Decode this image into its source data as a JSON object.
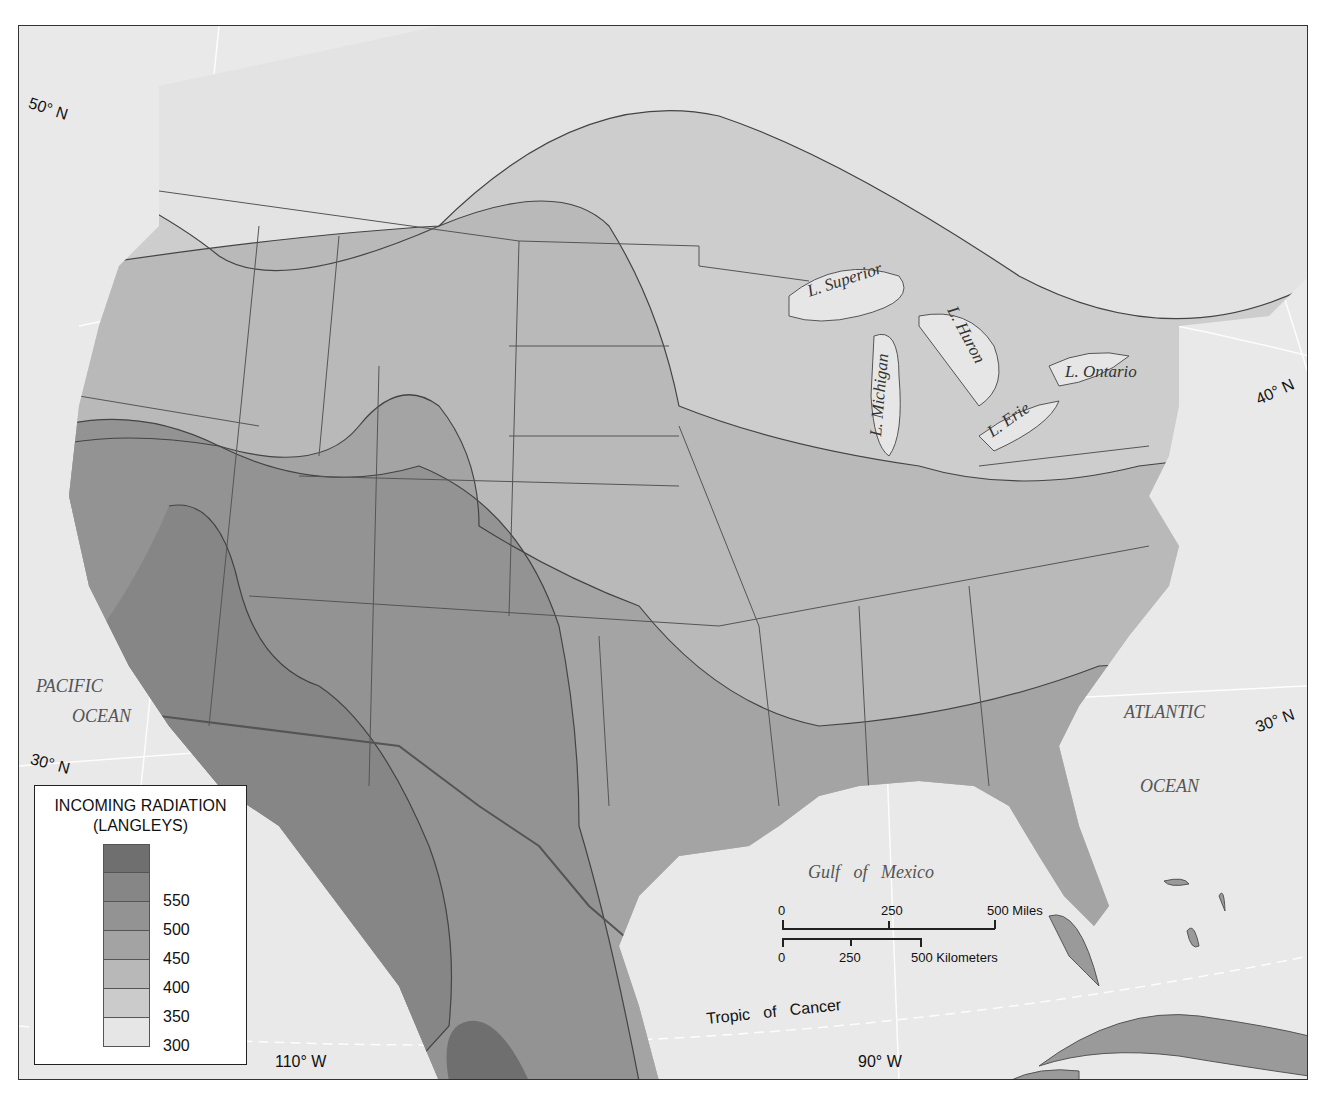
{
  "map": {
    "type": "choropleth-contour",
    "subject": "Incoming solar radiation over North America",
    "legend": {
      "title_line1": "INCOMING RADIATION",
      "title_line2": "(LANGLEYS)",
      "classes": [
        {
          "label": "",
          "color": "#6f6f6f"
        },
        {
          "label": "550",
          "color": "#868686"
        },
        {
          "label": "500",
          "color": "#939393"
        },
        {
          "label": "450",
          "color": "#a3a3a3"
        },
        {
          "label": "400",
          "color": "#b8b8b8"
        },
        {
          "label": "350",
          "color": "#cbcbcb"
        },
        {
          "label": "300",
          "color": "#e6e6e6"
        }
      ]
    },
    "water_labels": {
      "pacific_1": "PACIFIC",
      "pacific_2": "OCEAN",
      "atlantic_1": "ATLANTIC",
      "atlantic_2": "OCEAN",
      "gulf": "Gulf   of   Mexico"
    },
    "lake_labels": {
      "superior": "L. Superior",
      "michigan": "L. Michigan",
      "huron": "L. Huron",
      "erie": "L. Erie",
      "ontario": "L. Ontario"
    },
    "graticule_labels": {
      "lat_50_west": "50° N",
      "lat_40_east": "40° N",
      "lat_30_west": "30° N",
      "lat_30_east": "30° N",
      "lon_110": "110° W",
      "lon_90": "90° W",
      "tropic": "Tropic   of   Cancer"
    },
    "scale_bar": {
      "miles": {
        "ticks": [
          "0",
          "250",
          "500 Miles"
        ]
      },
      "kilometers": {
        "ticks": [
          "0",
          "250",
          "500 Kilometers"
        ]
      }
    },
    "colors": {
      "water": "#e9e9e9",
      "land_low": "#e2e2e2",
      "border": "#555555",
      "frame": "#333333"
    }
  }
}
